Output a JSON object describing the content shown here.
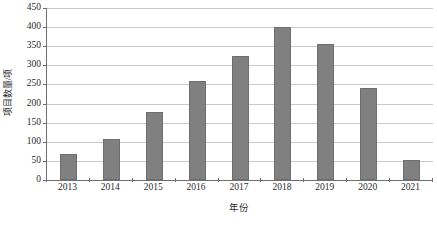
{
  "chart_data": {
    "type": "bar",
    "title": "",
    "subtitle": "",
    "xlabel": "年份",
    "ylabel": "项目数量/项",
    "categories": [
      "2013",
      "2014",
      "2015",
      "2016",
      "2017",
      "2018",
      "2019",
      "2020",
      "2021"
    ],
    "values": [
      67,
      108,
      177,
      260,
      325,
      400,
      357,
      242,
      52
    ],
    "series": [
      {
        "name": "项目数量",
        "values": [
          67,
          108,
          177,
          260,
          325,
          400,
          357,
          242,
          52
        ]
      }
    ],
    "ylim": [
      0,
      450
    ],
    "ytick_step": 50,
    "yticks": [
      0,
      50,
      100,
      150,
      200,
      250,
      300,
      350,
      400,
      450
    ],
    "ytick_labels": [
      "0",
      "50",
      "100",
      "150",
      "200",
      "250",
      "300",
      "350",
      "400",
      "450"
    ],
    "grid": true,
    "grid_axis": "y",
    "legend": false,
    "legend_position": "none",
    "bar_color": "#808080",
    "bar_edge_color": "#6e6e6e",
    "grid_color": "#c9c9c9",
    "axis_color": "#6f6f6f",
    "background_color": "#ffffff",
    "annotations": []
  }
}
